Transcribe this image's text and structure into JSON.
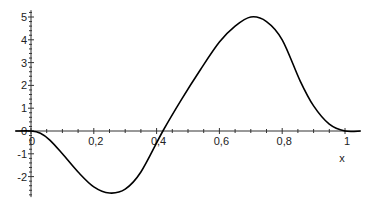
{
  "chart_data": {
    "type": "line",
    "title": "",
    "xlabel": "x",
    "ylabel": "",
    "xlim": [
      -0.05,
      1.05
    ],
    "ylim": [
      -2.9,
      5.3
    ],
    "x_ticks": [
      "0",
      "0,2",
      "0,4",
      "0,6",
      "0,8",
      "1"
    ],
    "x_tick_values": [
      0,
      0.2,
      0.4,
      0.6,
      0.8,
      1.0
    ],
    "y_ticks": [
      "-2",
      "-1",
      "0",
      "1",
      "2",
      "3",
      "4",
      "5"
    ],
    "y_tick_values": [
      -2,
      -1,
      0,
      1,
      2,
      3,
      4,
      5
    ],
    "grid": false,
    "legend": null,
    "series": [
      {
        "name": "f(x)",
        "color": "#000000",
        "x": [
          -0.05,
          0.0,
          0.03,
          0.06,
          0.1,
          0.15,
          0.2,
          0.25,
          0.3,
          0.35,
          0.42,
          0.48,
          0.54,
          0.6,
          0.65,
          0.7,
          0.75,
          0.8,
          0.857,
          0.9,
          0.95,
          1.0,
          1.05
        ],
        "values": [
          0,
          0,
          -0.1,
          -0.4,
          -1.0,
          -1.8,
          -2.45,
          -2.72,
          -2.55,
          -1.8,
          0,
          1.4,
          2.7,
          3.9,
          4.6,
          5.0,
          4.8,
          4.0,
          2.2,
          1.1,
          0.3,
          0,
          0
        ]
      }
    ]
  }
}
